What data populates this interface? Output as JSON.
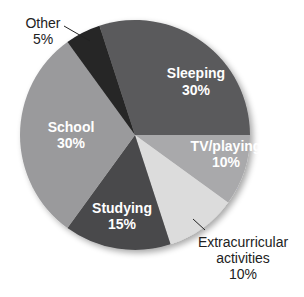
{
  "chart_data": {
    "type": "pie",
    "title": "",
    "slices": [
      {
        "label": "Sleeping",
        "value": 30,
        "display": "30%",
        "color": "#5a5a5c"
      },
      {
        "label": "TV/playing",
        "value": 10,
        "display": "10%",
        "color": "#a9a9ab"
      },
      {
        "label": "Extracurricular activities",
        "value": 10,
        "display": "10%",
        "color": "#dcdcdc"
      },
      {
        "label": "Studying",
        "value": 15,
        "display": "15%",
        "color": "#4a4a4c"
      },
      {
        "label": "School",
        "value": 30,
        "display": "30%",
        "color": "#9a9a9c"
      },
      {
        "label": "Other",
        "value": 5,
        "display": "5%",
        "color": "#262628"
      }
    ],
    "start_angle_deg": -18,
    "direction": "clockwise",
    "legend": "none (labels on/near slices)"
  },
  "labels": {
    "sleeping": {
      "name": "Sleeping",
      "pct": "30%"
    },
    "tv": {
      "name": "TV/playing",
      "pct": "10%"
    },
    "extra": {
      "line1": "Extracurricular",
      "line2": "activities",
      "pct": "10%"
    },
    "studying": {
      "name": "Studying",
      "pct": "15%"
    },
    "school": {
      "name": "School",
      "pct": "30%"
    },
    "other": {
      "name": "Other",
      "pct": "5%"
    }
  }
}
